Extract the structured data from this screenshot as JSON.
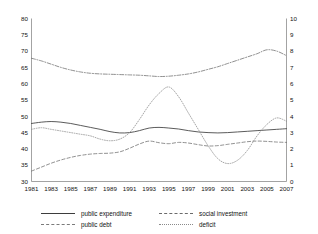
{
  "chart_data": {
    "type": "line",
    "title": "",
    "xlabel": "",
    "ylabel": "",
    "y2label": "",
    "grid": false,
    "legend_position": "bottom",
    "x": [
      1981,
      1982,
      1983,
      1984,
      1985,
      1986,
      1987,
      1988,
      1989,
      1990,
      1991,
      1992,
      1993,
      1994,
      1995,
      1996,
      1997,
      1998,
      1999,
      2000,
      2001,
      2002,
      2003,
      2004,
      2005,
      2006,
      2007
    ],
    "xtick_labels": [
      "1981",
      "1983",
      "1985",
      "1987",
      "1989",
      "1991",
      "1993",
      "1995",
      "1997",
      "1999",
      "2001",
      "2003",
      "2005",
      "2007"
    ],
    "xticks": [
      1981,
      1983,
      1985,
      1987,
      1989,
      1991,
      1993,
      1995,
      1997,
      1999,
      2001,
      2003,
      2005,
      2007
    ],
    "ylim": [
      30,
      80
    ],
    "yticks": [
      30,
      35,
      40,
      45,
      50,
      55,
      60,
      65,
      70,
      75,
      80
    ],
    "ytick_labels": [
      "30",
      "35",
      "40",
      "45",
      "50",
      "55",
      "60",
      "65",
      "70",
      "75",
      "80"
    ],
    "y2lim": [
      0,
      10
    ],
    "y2ticks": [
      0,
      1,
      2,
      3,
      4,
      5,
      6,
      7,
      8,
      9,
      10
    ],
    "y2tick_labels": [
      "0",
      "1",
      "2",
      "3",
      "4",
      "5",
      "6",
      "7",
      "8",
      "9",
      "10"
    ],
    "series": [
      {
        "name": "public expenditure",
        "axis": "left",
        "style": "solid",
        "color": "#3d3d3d",
        "values": [
          47.8,
          48.2,
          48.4,
          48.2,
          47.8,
          47.2,
          46.6,
          46.0,
          45.3,
          44.9,
          45.0,
          45.6,
          46.4,
          46.6,
          46.4,
          46.1,
          45.6,
          45.2,
          45.0,
          44.9,
          45.0,
          45.2,
          45.4,
          45.6,
          45.8,
          46.0,
          46.2
        ]
      },
      {
        "name": "social investment",
        "axis": "left",
        "style": "dashed",
        "color": "#6b6b6b",
        "values": [
          33.2,
          34.4,
          35.6,
          36.6,
          37.4,
          38.0,
          38.4,
          38.6,
          38.7,
          39.1,
          40.2,
          41.5,
          42.4,
          41.9,
          41.6,
          42.0,
          41.8,
          41.3,
          40.9,
          41.0,
          41.4,
          41.8,
          42.2,
          42.4,
          42.3,
          42.1,
          42.0
        ]
      },
      {
        "name": "public debt",
        "axis": "left",
        "style": "dashdot",
        "color": "#6b6b6b",
        "values": [
          67.8,
          67.0,
          66.0,
          65.0,
          64.2,
          63.6,
          63.2,
          63.0,
          62.9,
          62.8,
          62.7,
          62.6,
          62.4,
          62.2,
          62.3,
          62.6,
          63.0,
          63.6,
          64.4,
          65.2,
          66.2,
          67.2,
          68.2,
          69.2,
          70.4,
          70.0,
          68.6
        ]
      },
      {
        "name": "deficit",
        "axis": "right",
        "style": "dotted",
        "color": "#8a8a8a",
        "values": [
          3.2,
          3.3,
          3.2,
          3.1,
          3.0,
          2.9,
          2.8,
          2.6,
          2.5,
          2.6,
          3.0,
          3.8,
          4.7,
          5.4,
          5.8,
          5.2,
          4.2,
          3.2,
          2.2,
          1.4,
          1.1,
          1.3,
          1.9,
          2.8,
          3.5,
          3.9,
          3.7
        ]
      }
    ]
  },
  "legend": {
    "items": [
      {
        "label": "public expenditure",
        "style": "solid"
      },
      {
        "label": "social investment",
        "style": "dashed"
      },
      {
        "label": "public debt",
        "style": "dashdot"
      },
      {
        "label": "deficit",
        "style": "dotted"
      }
    ]
  }
}
